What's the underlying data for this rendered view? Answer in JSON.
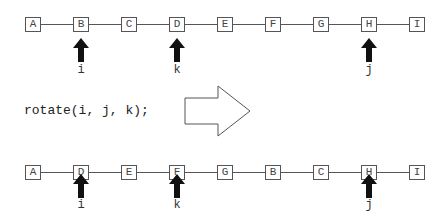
{
  "before": {
    "nodes": [
      "A",
      "B",
      "C",
      "D",
      "E",
      "F",
      "G",
      "H",
      "I"
    ],
    "pointers": [
      {
        "name": "i",
        "index": 1
      },
      {
        "name": "k",
        "index": 3
      },
      {
        "name": "j",
        "index": 7
      }
    ]
  },
  "operation": {
    "code": "rotate(i, j, k);",
    "arrow_icon": "right-arrow-outline"
  },
  "after": {
    "nodes": [
      "A",
      "D",
      "E",
      "F",
      "G",
      "B",
      "C",
      "H",
      "I"
    ],
    "pointers": [
      {
        "name": "i",
        "index": 1
      },
      {
        "name": "k",
        "index": 3
      },
      {
        "name": "j",
        "index": 7
      }
    ]
  }
}
